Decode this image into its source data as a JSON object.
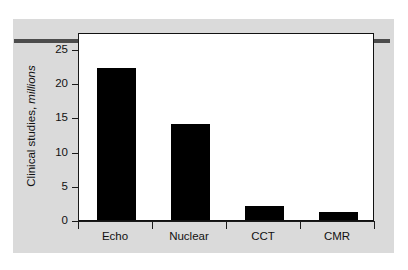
{
  "figure": {
    "panel_color": "#dadada",
    "rule_color": "#4c4c4c",
    "plot_bg": "#ffffff",
    "bar_color": "#000000",
    "axis_color": "#1a1a1a"
  },
  "axis": {
    "ylabel_main": "Clinical studies,",
    "ylabel_em": "millions",
    "yticks": [
      "0",
      "5",
      "10",
      "15",
      "20",
      "25"
    ],
    "xticks": [
      "Echo",
      "Nuclear",
      "CCT",
      "CMR"
    ]
  },
  "chart_data": {
    "type": "bar",
    "title": "",
    "xlabel": "",
    "ylabel": "Clinical studies, millions",
    "categories": [
      "Echo",
      "Nuclear",
      "CCT",
      "CMR"
    ],
    "values": [
      22.2,
      14.1,
      2.1,
      1.1
    ],
    "ylim": [
      0,
      27.5
    ],
    "ytick_values": [
      0,
      5,
      10,
      15,
      20,
      25
    ],
    "grid": false,
    "legend": false
  }
}
